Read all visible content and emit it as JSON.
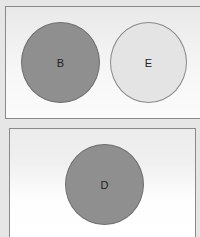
{
  "panels": [
    {
      "circles": [
        {
          "label": "B",
          "fill": "#8f8f8f"
        },
        {
          "label": "E",
          "fill": "#e4e4e4"
        }
      ]
    },
    {
      "circles": [
        {
          "label": "D",
          "fill": "#8f8f8f"
        }
      ]
    }
  ]
}
